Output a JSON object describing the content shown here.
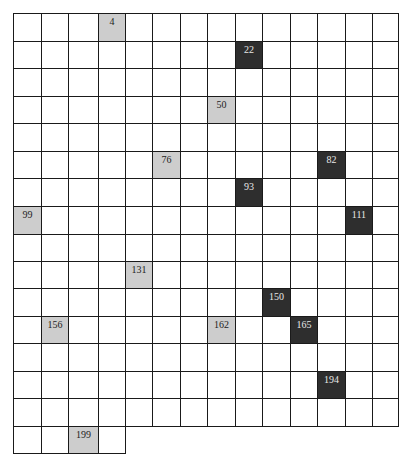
{
  "grid": {
    "columns": 14,
    "full_rows": 15,
    "last_row_cells": 4,
    "col_edges": [
      13,
      41,
      68,
      98,
      125,
      152,
      180,
      207,
      235,
      262,
      290,
      317,
      345,
      372,
      398
    ],
    "row_edges": [
      13,
      41,
      68,
      96,
      123,
      151,
      178,
      206,
      234,
      261,
      288,
      316,
      343,
      371,
      398,
      426,
      453
    ],
    "colors": {
      "light": "#cdcdcd",
      "dark": "#2e2e2e",
      "border": "#1a1a1a",
      "empty": "#ffffff"
    },
    "marked_cells": [
      {
        "label": "4",
        "row": 0,
        "col": 3,
        "shade": "light"
      },
      {
        "label": "22",
        "row": 1,
        "col": 8,
        "shade": "dark"
      },
      {
        "label": "50",
        "row": 3,
        "col": 7,
        "shade": "light"
      },
      {
        "label": "76",
        "row": 5,
        "col": 5,
        "shade": "light"
      },
      {
        "label": "82",
        "row": 5,
        "col": 11,
        "shade": "dark"
      },
      {
        "label": "93",
        "row": 6,
        "col": 8,
        "shade": "dark"
      },
      {
        "label": "99",
        "row": 7,
        "col": 0,
        "shade": "light"
      },
      {
        "label": "111",
        "row": 7,
        "col": 12,
        "shade": "dark"
      },
      {
        "label": "131",
        "row": 9,
        "col": 4,
        "shade": "light"
      },
      {
        "label": "150",
        "row": 10,
        "col": 9,
        "shade": "dark"
      },
      {
        "label": "156",
        "row": 11,
        "col": 1,
        "shade": "light"
      },
      {
        "label": "162",
        "row": 11,
        "col": 7,
        "shade": "light"
      },
      {
        "label": "165",
        "row": 11,
        "col": 10,
        "shade": "dark"
      },
      {
        "label": "194",
        "row": 13,
        "col": 11,
        "shade": "dark"
      },
      {
        "label": "199",
        "row": 15,
        "col": 2,
        "shade": "light"
      }
    ]
  }
}
